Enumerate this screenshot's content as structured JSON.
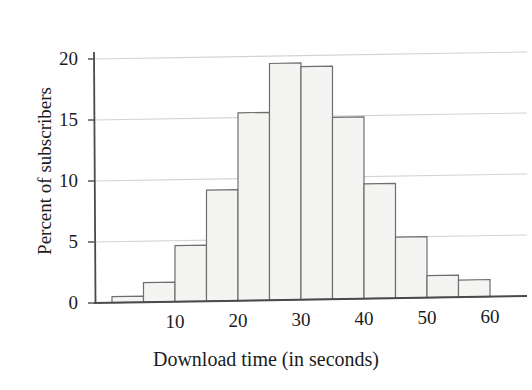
{
  "chart_data": {
    "type": "bar",
    "title": "",
    "subtitle": "",
    "xlabel": "Download time (in seconds)",
    "ylabel": "Percent of subscribers",
    "xlim": [
      0,
      60
    ],
    "ylim": [
      0,
      20.5
    ],
    "grid": true,
    "legend": null,
    "bin_width": 5,
    "x_ticks": [
      10,
      20,
      30,
      40,
      50,
      60
    ],
    "x_tick_labels": [
      "10",
      "20",
      "30",
      "40",
      "50",
      "60"
    ],
    "y_ticks": [
      0,
      5,
      10,
      15,
      20
    ],
    "y_tick_labels": [
      "0",
      "5",
      "10",
      "15",
      "20"
    ],
    "categories": [
      "0-5",
      "5-10",
      "10-15",
      "15-20",
      "20-25",
      "25-30",
      "30-35",
      "35-40",
      "40-45",
      "45-50",
      "50-55",
      "55-60"
    ],
    "bin_starts": [
      0,
      5,
      10,
      15,
      20,
      25,
      30,
      35,
      40,
      45,
      50,
      55
    ],
    "values": [
      0.5,
      1.6,
      4.6,
      9.1,
      15.4,
      19.4,
      19.1,
      14.9,
      9.4,
      5.0,
      1.8,
      1.4
    ],
    "bar_fill_color": "#f4f4f2",
    "bar_edge_color": "#6e6e6e",
    "grid_color": "#d3d3d3",
    "axis_color": "#4a4a4a",
    "text_color": "#1b1b1b"
  }
}
